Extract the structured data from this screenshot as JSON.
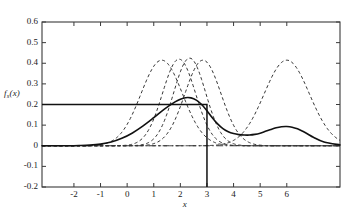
{
  "chart_data": {
    "type": "line",
    "title": "",
    "xlabel": "x",
    "ylabel": "f_s(x)",
    "ylabel_base": "f",
    "ylabel_sub": "s",
    "ylabel_arg": "(x)",
    "xlim": [
      -3.2,
      8.0
    ],
    "ylim": [
      -0.2,
      0.6
    ],
    "xticks": [
      -2,
      -1,
      0,
      1,
      2,
      3,
      4,
      5,
      6
    ],
    "xticklabels": [
      "-2",
      "-1",
      "0",
      "1",
      "2",
      "3",
      "4",
      "5",
      "6"
    ],
    "yticks": [
      -0.2,
      -0.1,
      0,
      0.1,
      0.2,
      0.3,
      0.4,
      0.5,
      0.6
    ],
    "yticklabels": [
      "-0.2",
      "-0.1",
      "0",
      "0.1",
      "0.2",
      "0.3",
      "0.4",
      "0.5",
      "0.6"
    ],
    "grid": false,
    "legend": "none",
    "series": [
      {
        "name": "kernel-1",
        "style": "dashed",
        "type": "gaussian",
        "amplitude": 0.415,
        "mean": 1.3,
        "sigma": 0.78
      },
      {
        "name": "kernel-2",
        "style": "dashed",
        "type": "gaussian",
        "amplitude": 0.42,
        "mean": 1.95,
        "sigma": 0.62
      },
      {
        "name": "kernel-3",
        "style": "dashed",
        "type": "gaussian",
        "amplitude": 0.425,
        "mean": 2.35,
        "sigma": 0.6
      },
      {
        "name": "kernel-4",
        "style": "dashed",
        "type": "gaussian",
        "amplitude": 0.415,
        "mean": 2.85,
        "sigma": 0.68
      },
      {
        "name": "kernel-5",
        "style": "dashed",
        "type": "gaussian",
        "amplitude": 0.415,
        "mean": 6.0,
        "sigma": 0.85
      },
      {
        "name": "zero-reference-line",
        "style": "dash-dot",
        "type": "horizontal",
        "value": 0.0
      },
      {
        "name": "step-function",
        "style": "solid",
        "type": "step",
        "level": 0.2,
        "edge": 3.0,
        "drop_to": -0.2
      },
      {
        "name": "smoothed-estimate",
        "style": "solid",
        "type": "curve",
        "x": [
          -3.2,
          -2.6,
          -2.2,
          -1.8,
          -1.4,
          -1.0,
          -0.6,
          -0.2,
          0.2,
          0.6,
          1.0,
          1.4,
          1.8,
          2.0,
          2.2,
          2.4,
          2.6,
          2.8,
          3.0,
          3.2,
          3.4,
          3.6,
          3.8,
          4.0,
          4.2,
          4.4,
          4.6,
          4.8,
          5.0,
          5.2,
          5.4,
          5.6,
          5.8,
          6.0,
          6.2,
          6.4,
          6.6,
          6.8,
          7.0,
          7.4,
          8.0
        ],
        "y": [
          0.0,
          0.0,
          0.0,
          0.001,
          0.003,
          0.008,
          0.018,
          0.036,
          0.062,
          0.096,
          0.136,
          0.178,
          0.213,
          0.226,
          0.233,
          0.232,
          0.221,
          0.2,
          0.17,
          0.136,
          0.106,
          0.083,
          0.068,
          0.059,
          0.054,
          0.052,
          0.052,
          0.055,
          0.061,
          0.07,
          0.079,
          0.087,
          0.092,
          0.093,
          0.09,
          0.082,
          0.07,
          0.056,
          0.041,
          0.018,
          0.004
        ]
      }
    ],
    "colors": {
      "axis": "#3a3a3a",
      "solid_curve": "#111111",
      "dashed_curve": "#333333"
    }
  }
}
